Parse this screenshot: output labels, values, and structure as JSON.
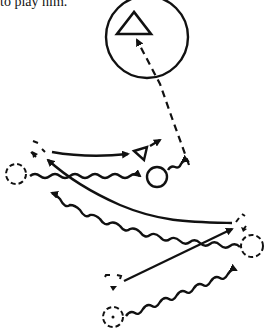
{
  "caption": "to play him.",
  "colors": {
    "ink": "#111111",
    "background": "#ffffff"
  },
  "legend_semantics": {
    "triangle": "defender",
    "circle": "attacker",
    "dashed-shape": "starting position",
    "solid-arrow": "player run / pass",
    "wavy-arrow": "dribble",
    "dashed-arrow": "shot / pass to target"
  },
  "diagram": {
    "target": {
      "shape": "circle-with-triangle",
      "cx": 147,
      "cy": 37,
      "r": 41
    },
    "players": [
      {
        "id": "def-start-upper",
        "shape": "triangle",
        "style": "dashed",
        "x": 38,
        "y": 153
      },
      {
        "id": "def-mid",
        "shape": "triangle",
        "style": "solid",
        "x": 145,
        "y": 153
      },
      {
        "id": "att-start-left",
        "shape": "circle",
        "style": "dashed",
        "x": 16,
        "y": 174
      },
      {
        "id": "att-ball",
        "shape": "circle",
        "style": "solid",
        "x": 157,
        "y": 177
      },
      {
        "id": "def-start-right",
        "shape": "triangle",
        "style": "dashed",
        "x": 238,
        "y": 222
      },
      {
        "id": "att-start-right",
        "shape": "circle",
        "style": "dashed",
        "x": 252,
        "y": 246
      },
      {
        "id": "def-start-lower",
        "shape": "triangle",
        "style": "dashed",
        "x": 114,
        "y": 283
      },
      {
        "id": "att-start-lower",
        "shape": "circle",
        "style": "dashed",
        "x": 113,
        "y": 317
      }
    ]
  }
}
